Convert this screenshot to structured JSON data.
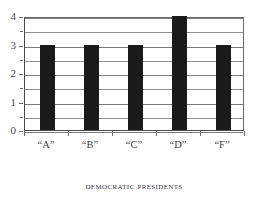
{
  "chart_data": {
    "type": "bar",
    "title": "",
    "caption": "Democratic Presidents",
    "xlabel": "",
    "ylabel": "",
    "categories": [
      "“A”",
      "“B”",
      "“C”",
      "“D”",
      "“F”"
    ],
    "values": [
      3,
      3,
      3,
      4,
      3
    ],
    "ylim": [
      0,
      4
    ],
    "ytick_labels": [
      "0",
      "1",
      "2",
      "3",
      "4"
    ],
    "ytick_values": [
      0,
      1,
      2,
      3,
      4
    ],
    "gridlines": [
      0,
      0.5,
      1,
      1.5,
      2,
      2.5,
      3,
      3.5,
      4
    ],
    "grid": true,
    "legend": false,
    "bar_color": "#1a1a1a",
    "grid_color": "#8c8c8c",
    "axis_color": "#4a4a4a",
    "background": "#ffffff"
  }
}
